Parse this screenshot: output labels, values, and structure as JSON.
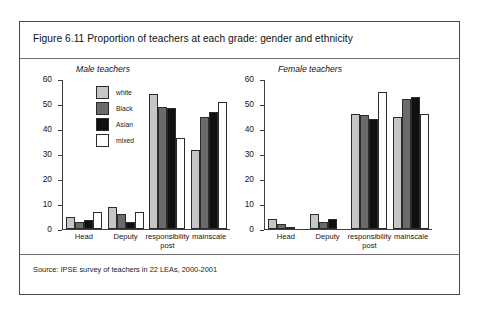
{
  "figure": {
    "title": "Figure 6.11 Proportion of teachers at each grade: gender and ethnicity",
    "source": "Source: IPSE survey of teachers in 22 LEAs, 2000-2001"
  },
  "legend": {
    "items": [
      {
        "label": "white",
        "color": "#c6c6c6"
      },
      {
        "label": "Black",
        "color": "#6b6b6b"
      },
      {
        "label": "Asian",
        "color": "#101010"
      },
      {
        "label": "mixed",
        "color": "#ffffff"
      }
    ]
  },
  "axis": {
    "ticks": [
      "60",
      "50",
      "40",
      "30",
      "20",
      "10",
      "0"
    ]
  },
  "chart_data": [
    {
      "type": "bar",
      "title": "Male teachers",
      "xlabel": "",
      "ylabel": "",
      "ylim": [
        0,
        60
      ],
      "yticks": [
        0,
        10,
        20,
        30,
        40,
        50,
        60
      ],
      "grid": false,
      "legend_position": "inside-top-left",
      "categories": [
        "Head",
        "Deputy",
        "responsibility\npost",
        "mainscale"
      ],
      "series": [
        {
          "name": "white",
          "values": [
            5,
            9,
            54,
            31.5
          ]
        },
        {
          "name": "Black",
          "values": [
            3,
            6,
            49,
            45
          ]
        },
        {
          "name": "Asian",
          "values": [
            3.5,
            3,
            48.5,
            47
          ]
        },
        {
          "name": "mixed",
          "values": [
            7,
            7,
            36.5,
            51
          ]
        }
      ]
    },
    {
      "type": "bar",
      "title": "Female teachers",
      "xlabel": "",
      "ylabel": "",
      "ylim": [
        0,
        60
      ],
      "yticks": [
        0,
        10,
        20,
        30,
        40,
        50,
        60
      ],
      "grid": false,
      "legend_position": "none",
      "categories": [
        "Head",
        "Deputy",
        "responsibility\npost",
        "mainscale"
      ],
      "series": [
        {
          "name": "white",
          "values": [
            4,
            6,
            46,
            45
          ]
        },
        {
          "name": "Black",
          "values": [
            2,
            3,
            45.5,
            52
          ]
        },
        {
          "name": "Asian",
          "values": [
            1,
            4,
            44,
            53
          ]
        },
        {
          "name": "mixed",
          "values": [
            0,
            0,
            55,
            46
          ]
        }
      ]
    }
  ]
}
